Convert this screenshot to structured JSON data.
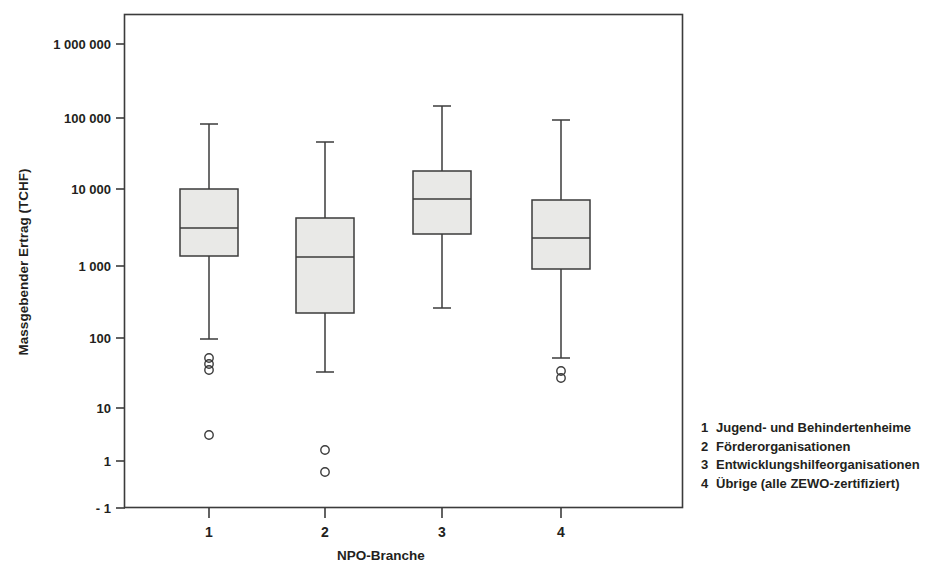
{
  "chart_data": {
    "type": "box",
    "title": "",
    "xlabel": "NPO-Branche",
    "ylabel": "Massgebender Ertrag (TCHF)",
    "yscale": "log",
    "ytick_labels": [
      "1 000 000",
      "100 000",
      "10 000",
      "1 000",
      "100",
      "10",
      "1",
      "- 1"
    ],
    "ytick_values": [
      1000000,
      100000,
      10000,
      1000,
      100,
      10,
      1,
      -1
    ],
    "ytick_y": [
      44,
      118,
      189,
      266,
      338,
      408,
      461,
      508
    ],
    "xtick_labels": [
      "1",
      "2",
      "3",
      "4"
    ],
    "xtick_x": [
      209,
      325,
      442,
      561
    ],
    "grid": false,
    "legend_position": "right-outside",
    "categories": [
      "1",
      "2",
      "3",
      "4"
    ],
    "boxes": [
      {
        "category": "1",
        "whisker_high": 68000,
        "q3": 10000,
        "median": 2900,
        "q1": 1200,
        "whisker_low": 68,
        "outliers": [
          42,
          36,
          31,
          2.7
        ],
        "px": {
          "x": 209,
          "cap_hi": 124,
          "top": 189,
          "med": 228,
          "bottom": 256,
          "cap_lo": 339,
          "outlier_y": [
            358,
            364,
            370,
            435
          ]
        }
      },
      {
        "category": "2",
        "whisker_high": 31000,
        "q3": 4100,
        "median": 1200,
        "q1": 200,
        "whisker_low": 31,
        "outliers": [
          1.1,
          0.36
        ],
        "px": {
          "x": 325,
          "cap_hi": 142,
          "top": 218,
          "med": 257,
          "bottom": 313,
          "cap_lo": 372,
          "outlier_y": [
            450,
            472
          ]
        }
      },
      {
        "category": "3",
        "whisker_high": 150000,
        "q3": 17000,
        "median": 7000,
        "q1": 2600,
        "whisker_low": 230,
        "outliers": [],
        "px": {
          "x": 442,
          "cap_hi": 106,
          "top": 171,
          "med": 199,
          "bottom": 234,
          "cap_lo": 308,
          "outlier_y": []
        }
      },
      {
        "category": "4",
        "whisker_high": 90000,
        "q3": 7000,
        "median": 2100,
        "q1": 900,
        "whisker_low": 36,
        "outliers": [
          30,
          26
        ],
        "px": {
          "x": 561,
          "cap_hi": 120,
          "top": 200,
          "med": 238,
          "bottom": 269,
          "cap_lo": 358,
          "outlier_y": [
            371,
            378
          ]
        }
      }
    ],
    "legend_entries": [
      {
        "num": "1",
        "label": "Jugend- und Behindertenheime"
      },
      {
        "num": "2",
        "label": "Förderorganisationen"
      },
      {
        "num": "3",
        "label": "Entwicklungshilfeorganisationen"
      },
      {
        "num": "4",
        "label": "Übrige (alle ZEWO-zertifiziert)"
      }
    ],
    "colors": {
      "box_fill": "#e9e9e7",
      "line": "#3b3b3b",
      "text": "#231f20",
      "background": "#ffffff"
    }
  }
}
